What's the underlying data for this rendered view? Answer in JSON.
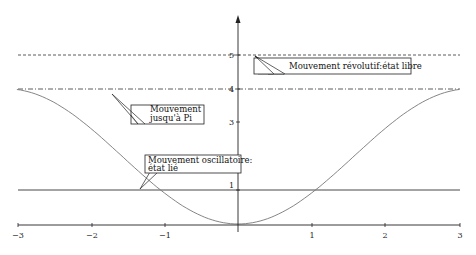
{
  "chart_data": {
    "type": "line",
    "title": "",
    "xlabel": "",
    "ylabel": "",
    "xlim": [
      -3,
      3
    ],
    "ylim": [
      0,
      6
    ],
    "grid": false,
    "x_ticks": [
      "−3",
      "−2",
      "−1",
      "1",
      "2",
      "3"
    ],
    "y_ticks": [
      "1",
      "3",
      "4",
      "5"
    ],
    "series": [
      {
        "name": "Potential 2(1 - cos x)",
        "style": "solid-gray",
        "function": "2*(1-cos(x))",
        "x": [
          -3,
          -2,
          -1,
          0,
          1,
          2,
          3
        ],
        "values": [
          3.98,
          2.83,
          0.92,
          0,
          0.92,
          2.83,
          3.98
        ]
      },
      {
        "name": "Energy level 1",
        "style": "solid",
        "constant": 1
      },
      {
        "name": "Energy level 4",
        "style": "dash-dot",
        "constant": 4
      },
      {
        "name": "Energy level 5",
        "style": "dashed",
        "constant": 5
      }
    ],
    "annotations": [
      {
        "text": "Mouvement révolutif:état libre",
        "points_to": [
          0.1,
          5
        ]
      },
      {
        "text_lines": [
          "Mouvement",
          "jusqu'à Pi"
        ],
        "points_to": [
          -1.4,
          4
        ]
      },
      {
        "text_lines": [
          "Mouvement oscillatoire:",
          "état lié"
        ],
        "points_to": [
          -1.6,
          1
        ]
      }
    ]
  },
  "labels": {
    "x": {
      "m3": "−3",
      "m2": "−2",
      "m1": "−1",
      "p1": "1",
      "p2": "2",
      "p3": "3"
    },
    "y": {
      "y1": "1",
      "y3": "3",
      "y4": "4",
      "y5": "5"
    },
    "ann_free": "Mouvement révolutif:état libre",
    "ann_pi_1": "Mouvement",
    "ann_pi_2": "jusqu'à Pi",
    "ann_osc_1": "Mouvement oscillatoire:",
    "ann_osc_2": "état lié"
  }
}
